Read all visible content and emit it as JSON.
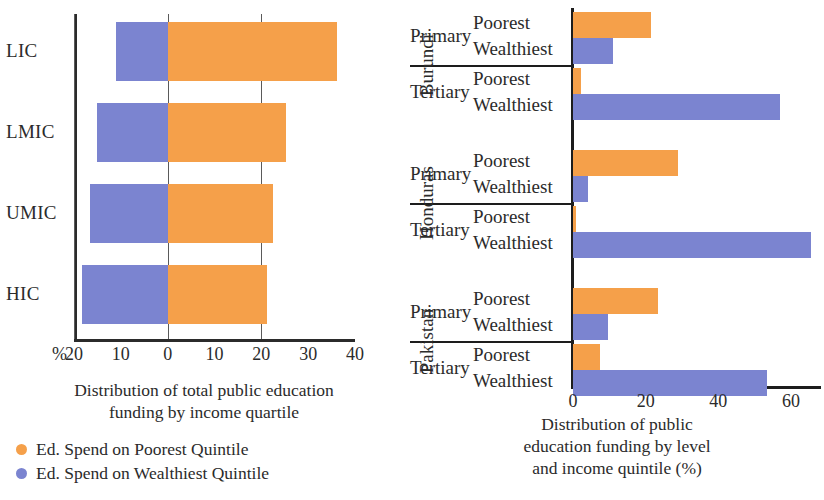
{
  "figure": {
    "legend": {
      "items": [
        {
          "label": "Ed. Spend on Poorest Quintile",
          "color": "#F5A04A",
          "dot": "legend-dot-poorest"
        },
        {
          "label": "Ed. Spend on Wealthiest Quintile",
          "color": "#7B84D0",
          "dot": "legend-dot-wealthiest"
        }
      ]
    },
    "colors": {
      "poorest": "#F5A04A",
      "wealthiest": "#7B84D0",
      "axis": "#2b2b2b",
      "grid": "#5a5a5a",
      "background": "#ffffff"
    }
  },
  "chart_data": [
    {
      "id": "left-chart",
      "type": "bar",
      "orientation": "horizontal",
      "diverging": true,
      "title": "",
      "caption_line1": "Distribution of total public education",
      "caption_line2": "funding by income quartile",
      "xlabel": "%",
      "ylabel": "",
      "xlim": [
        -20,
        40
      ],
      "xticks": [
        -20,
        -10,
        0,
        10,
        20,
        30,
        40
      ],
      "xticklabels": [
        "20",
        "10",
        "0",
        "10",
        "20",
        "30",
        "40"
      ],
      "gridlines": [
        -20,
        0,
        20
      ],
      "grid": true,
      "legend_position": "below",
      "categories": [
        "LIC",
        "LMIC",
        "UMIC",
        "HIC"
      ],
      "series": [
        {
          "name": "Ed. Spend on Poorest Quintile",
          "color": "#F5A04A",
          "values": [
            36.2,
            25.2,
            22.5,
            21.2
          ]
        },
        {
          "name": "Ed. Spend on Wealthiest Quintile",
          "color": "#7B84D0",
          "values": [
            -11.0,
            -15.0,
            -16.5,
            -18.2
          ]
        }
      ]
    },
    {
      "id": "right-chart",
      "type": "bar",
      "orientation": "horizontal",
      "diverging": false,
      "title": "",
      "caption_line1": "Distribution of public",
      "caption_line2": "education funding by level",
      "caption_line3": "and income quintile  (%)",
      "xlabel": "",
      "ylabel": "",
      "xlim": [
        0,
        68
      ],
      "xticks": [
        0,
        20,
        40,
        60
      ],
      "xticklabels": [
        "0",
        "20",
        "40",
        "60"
      ],
      "grid": false,
      "groups": [
        {
          "country": "Burundi",
          "levels": [
            {
              "level": "Primary",
              "rows": [
                {
                  "quintile": "Poorest",
                  "value": 21.5,
                  "series": "poorest"
                },
                {
                  "quintile": "Wealthiest",
                  "value": 11.0,
                  "series": "wealthiest"
                }
              ]
            },
            {
              "level": "Tertiary",
              "rows": [
                {
                  "quintile": "Poorest",
                  "value": 2.2,
                  "series": "poorest"
                },
                {
                  "quintile": "Wealthiest",
                  "value": 57.0,
                  "series": "wealthiest"
                }
              ]
            }
          ]
        },
        {
          "country": "Honduras",
          "levels": [
            {
              "level": "Primary",
              "rows": [
                {
                  "quintile": "Poorest",
                  "value": 29.0,
                  "series": "poorest"
                },
                {
                  "quintile": "Wealthiest",
                  "value": 4.0,
                  "series": "wealthiest"
                }
              ]
            },
            {
              "level": "Tertiary",
              "rows": [
                {
                  "quintile": "Poorest",
                  "value": 0.8,
                  "series": "poorest"
                },
                {
                  "quintile": "Wealthiest",
                  "value": 65.5,
                  "series": "wealthiest"
                }
              ]
            }
          ]
        },
        {
          "country": "Pakistan",
          "levels": [
            {
              "level": "Primary",
              "rows": [
                {
                  "quintile": "Poorest",
                  "value": 23.5,
                  "series": "poorest"
                },
                {
                  "quintile": "Wealthiest",
                  "value": 9.5,
                  "series": "wealthiest"
                }
              ]
            },
            {
              "level": "Tertiary",
              "rows": [
                {
                  "quintile": "Poorest",
                  "value": 7.5,
                  "series": "poorest"
                },
                {
                  "quintile": "Wealthiest",
                  "value": 53.5,
                  "series": "wealthiest"
                }
              ]
            }
          ]
        }
      ]
    }
  ]
}
